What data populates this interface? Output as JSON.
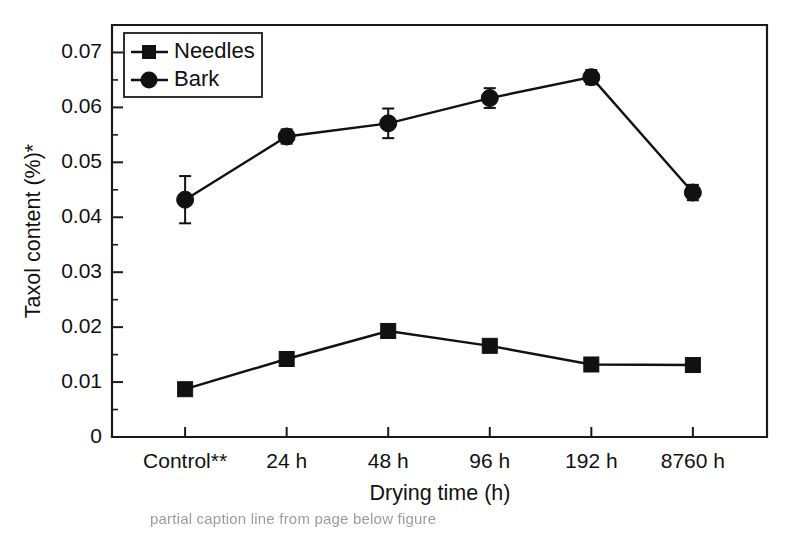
{
  "chart_data": {
    "type": "line",
    "title": "",
    "xlabel": "Drying time (h)",
    "ylabel": "Taxol content (%)*",
    "categories": [
      "Control**",
      "24 h",
      "48 h",
      "96 h",
      "192 h",
      "8760 h"
    ],
    "ylim": [
      0,
      0.075
    ],
    "yticks": [
      0,
      0.01,
      0.02,
      0.03,
      0.04,
      0.05,
      0.06,
      0.07
    ],
    "ytick_labels": [
      "0",
      "0.01",
      "0.02",
      "0.03",
      "0.04",
      "0.05",
      "0.06",
      "0.07"
    ],
    "minor_tick_step": 0.005,
    "grid": false,
    "legend_position": "top-left",
    "series": [
      {
        "name": "Needles",
        "marker": "square",
        "values": [
          0.0087,
          0.0142,
          0.0193,
          0.0166,
          0.0132,
          0.0131
        ],
        "errors": [
          0.0,
          0.0,
          0.0,
          0.0,
          0.0,
          0.0
        ]
      },
      {
        "name": "Bark",
        "marker": "circle",
        "values": [
          0.0432,
          0.0547,
          0.0571,
          0.0617,
          0.0655,
          0.0445
        ],
        "errors": [
          0.0043,
          0.0013,
          0.0027,
          0.0018,
          0.0013,
          0.0014
        ]
      }
    ]
  },
  "axes": {
    "y_title": "Taxol content (%)*",
    "x_title": "Drying time (h)"
  },
  "legend": {
    "entries": [
      {
        "label": "Needles"
      },
      {
        "label": "Bark"
      }
    ]
  },
  "caption": {
    "text": "partial caption line from page below figure"
  },
  "colors": {
    "line": "#111111",
    "marker": "#111111",
    "axis": "#1a1a1a",
    "background": "#ffffff"
  }
}
